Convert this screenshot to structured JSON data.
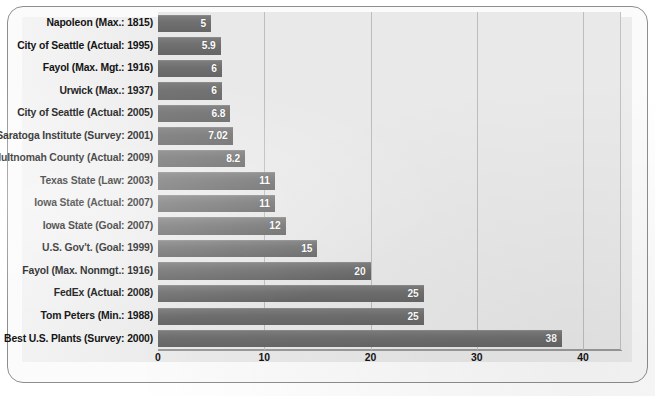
{
  "chart_data": {
    "type": "bar",
    "orientation": "horizontal",
    "title": "",
    "subtitle": "",
    "xlabel": "",
    "ylabel": "",
    "xlim": [
      0,
      40
    ],
    "xticks": [
      0,
      10,
      20,
      30,
      40
    ],
    "xtick_labels": [
      "0",
      "10",
      "20",
      "30",
      "40"
    ],
    "grid": "vertical",
    "legend": null,
    "categories": [
      "Napoleon (Max.: 1815)",
      "City of  Seattle (Actual: 1995)",
      "Fayol (Max. Mgt.: 1916)",
      "Urwick (Max.: 1937)",
      "City of  Seattle (Actual: 2005)",
      "Saratoga Institute (Survey: 2001)",
      "Multnomah County (Actual: 2009)",
      "Texas State (Law: 2003)",
      "Iowa State (Actual: 2007)",
      "Iowa State (Goal: 2007)",
      "U.S. Gov't. (Goal: 1999)",
      "Fayol (Max. Nonmgt.: 1916)",
      "FedEx (Actual: 2008)",
      "Tom Peters (Min.: 1988)",
      "Best U.S. Plants (Survey: 2000)"
    ],
    "values": [
      5,
      5.9,
      6,
      6,
      6.8,
      7.02,
      8.2,
      11,
      11,
      12,
      15,
      20,
      25,
      25,
      38
    ],
    "value_labels": [
      "5",
      "5.9",
      "6",
      "6",
      "6.8",
      "7.02",
      "8.2",
      "11",
      "11",
      "12",
      "15",
      "20",
      "25",
      "25",
      "38"
    ],
    "colors": {
      "bar": "#6f6f6f",
      "bar_label_text": "#ffffff",
      "plot_background": "#e9e9e9",
      "gridline": "#bdbdbd",
      "axis_text": "#141414",
      "frame_border": "#8e8e8e",
      "page_background": "#ffffff"
    }
  }
}
